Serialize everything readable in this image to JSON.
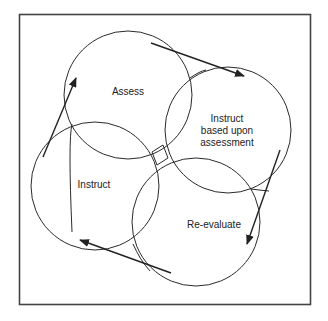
{
  "diagram": {
    "type": "cycle",
    "nodes": [
      {
        "id": "assess",
        "label": "Assess",
        "cx": 128,
        "cy": 95,
        "r": 64
      },
      {
        "id": "instruct-based",
        "label_lines": [
          "Instruct",
          "based upon",
          "assessment"
        ],
        "cx": 228,
        "cy": 130,
        "r": 63
      },
      {
        "id": "re-evaluate",
        "label": "Re-evaluate",
        "cx": 196,
        "cy": 222,
        "r": 64
      },
      {
        "id": "instruct",
        "label": "Instruct",
        "cx": 95,
        "cy": 186,
        "r": 64
      }
    ],
    "edges": [
      {
        "from": "instruct",
        "to": "assess"
      },
      {
        "from": "assess",
        "to": "instruct-based"
      },
      {
        "from": "instruct-based",
        "to": "re-evaluate"
      },
      {
        "from": "re-evaluate",
        "to": "instruct"
      }
    ],
    "colors": {
      "stroke": "#2a2a2a",
      "frame": "#444444",
      "background": "#ffffff"
    }
  }
}
